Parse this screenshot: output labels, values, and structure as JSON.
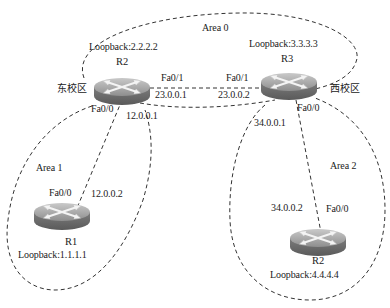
{
  "diagram": {
    "type": "ospf-multi-area-topology",
    "areas": [
      {
        "id": "area0",
        "label": "Area 0"
      },
      {
        "id": "area1",
        "label": "Area 1"
      },
      {
        "id": "area2",
        "label": "Area 2"
      }
    ],
    "campus_labels": {
      "east": "东校区",
      "west": "西校区"
    },
    "routers": [
      {
        "id": "r2_top",
        "name": "R2",
        "loopback": "Loopback:2.2.2.2"
      },
      {
        "id": "r3",
        "name": "R3",
        "loopback": "Loopback:3.3.3.3"
      },
      {
        "id": "r1",
        "name": "R1",
        "loopback": "Loopback:1.1.1.1"
      },
      {
        "id": "r2_bottom",
        "name": "R2",
        "loopback": "Loopback:4.4.4.4"
      }
    ],
    "interfaces": {
      "r2_fa01": "Fa0/1",
      "r2_fa01_ip": "23.0.0.1",
      "r2_fa00": "Fa0/0",
      "r2_fa00_ip": "12.0.0.1",
      "r3_fa01": "Fa0/1",
      "r3_fa01_ip": "23.0.0.2",
      "r3_fa00": "Fa0/0",
      "r3_fa00_ip": "34.0.0.1",
      "r1_fa00": "Fa0/0",
      "r1_fa00_ip": "12.0.0.2",
      "r4_fa00": "Fa0/0",
      "r4_fa00_ip": "34.0.0.2"
    },
    "links": [
      {
        "from": "R2 Fa0/1 23.0.0.1",
        "to": "R3 Fa0/1 23.0.0.2"
      },
      {
        "from": "R2 Fa0/0 12.0.0.1",
        "to": "R1 Fa0/0 12.0.0.2"
      },
      {
        "from": "R3 Fa0/0 34.0.0.1",
        "to": "R2 Fa0/0 34.0.0.2"
      }
    ]
  }
}
